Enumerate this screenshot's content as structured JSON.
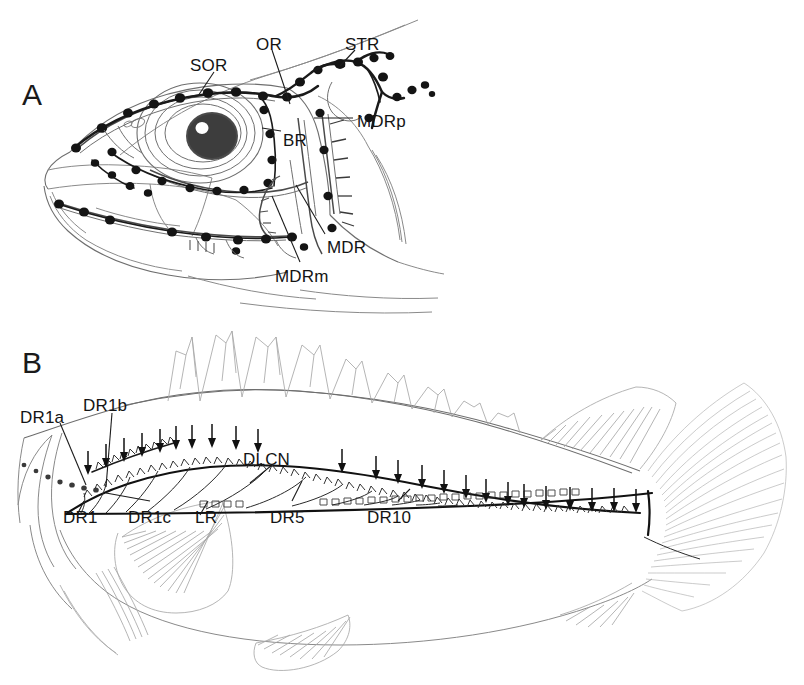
{
  "figure": {
    "background_color": "#ffffff",
    "ink_color": "#141414",
    "outline_color": "#8a8a8a",
    "width": 804,
    "height": 685
  },
  "panels": [
    {
      "id": "A",
      "letter": "A",
      "subject": "fish head lateral view with cephalic lateral line canals and superficial neuromasts",
      "labels": [
        {
          "key": "sor",
          "text": "SOR",
          "x": 190,
          "y": 57,
          "desc": "supraorbital canal"
        },
        {
          "key": "or",
          "text": "OR",
          "x": 256,
          "y": 36,
          "desc": "otic canal"
        },
        {
          "key": "str",
          "text": "STR",
          "x": 345,
          "y": 36,
          "desc": "supratemporal canal"
        },
        {
          "key": "br",
          "text": "BR",
          "x": 283,
          "y": 132,
          "desc": "buccal ramus"
        },
        {
          "key": "mdrp",
          "text": "MDRp",
          "x": 357,
          "y": 113,
          "desc": "mandibular ramus posterior"
        },
        {
          "key": "mdr",
          "text": "MDR",
          "x": 327,
          "y": 239,
          "desc": "mandibular ramus"
        },
        {
          "key": "mdrm",
          "text": "MDRm",
          "x": 275,
          "y": 268,
          "desc": "mandibular ramus medial"
        }
      ]
    },
    {
      "id": "B",
      "letter": "B",
      "subject": "whole fish lateral view with dorsal rows of superficial neuromasts and lateral line canal",
      "labels": [
        {
          "key": "dr1a",
          "text": "DR1a",
          "x": 20,
          "y": 409,
          "desc": "dorsal row 1a"
        },
        {
          "key": "dr1b",
          "text": "DR1b",
          "x": 83,
          "y": 397,
          "desc": "dorsal row 1b"
        },
        {
          "key": "dlcn",
          "text": "DLCN",
          "x": 243,
          "y": 451,
          "desc": "dorsal lateral line canal neuromasts"
        },
        {
          "key": "dr1",
          "text": "DR1",
          "x": 63,
          "y": 509,
          "desc": "dorsal row 1"
        },
        {
          "key": "dr1c",
          "text": "DR1c",
          "x": 128,
          "y": 509,
          "desc": "dorsal row 1c"
        },
        {
          "key": "lr",
          "text": "LR",
          "x": 195,
          "y": 509,
          "desc": "lateral row"
        },
        {
          "key": "dr5",
          "text": "DR5",
          "x": 270,
          "y": 509,
          "desc": "dorsal row 5"
        },
        {
          "key": "dr10",
          "text": "DR10",
          "x": 367,
          "y": 509,
          "desc": "dorsal row 10"
        }
      ],
      "arrow_count": 24,
      "arrow_glyph": "down-arrow"
    }
  ]
}
